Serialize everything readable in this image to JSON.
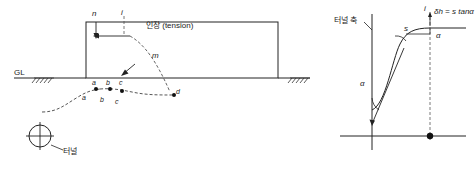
{
  "figure": {
    "title": "",
    "type": "engineering-diagram",
    "colors": {
      "line": "#222222",
      "dashed": "#555555",
      "hatch": "#333333",
      "background": "#ffffff"
    }
  },
  "left_panel": {
    "labels": {
      "gl": "GL",
      "n": "n",
      "i": "i",
      "m": "m",
      "tension_ko": "인장 (tension)",
      "a_upper": "a",
      "b_upper": "b",
      "c_upper": "c",
      "d_upper": "d",
      "a_lower": "a",
      "b_lower": "b",
      "c_lower": "c",
      "tunnel_ko": "터널"
    }
  },
  "right_panel": {
    "labels": {
      "tunnel_axis_ko": "터널 축",
      "delta_h": "δh = s tanα",
      "alpha_top": "α",
      "alpha_left": "α",
      "s": "s",
      "i": "i"
    }
  }
}
